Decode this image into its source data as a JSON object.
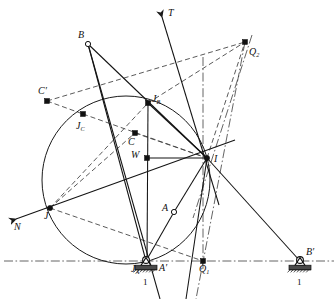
{
  "figure": {
    "type": "geometric-diagram",
    "width": 334,
    "height": 299,
    "stroke_color": "#1a1a1a",
    "accent_color": "#555555",
    "ground_hatch_color": "#3a3a3a"
  },
  "points": [
    {
      "id": "B",
      "label": "B",
      "marker": "open-circle",
      "x": 88,
      "y": 44,
      "lx": 78,
      "ly": 30
    },
    {
      "id": "Q2",
      "label": "Q",
      "sub": "2",
      "marker": "dot",
      "x": 245,
      "y": 42,
      "lx": 249,
      "ly": 47
    },
    {
      "id": "Cp",
      "label": "C",
      "prime": "′",
      "marker": "dot",
      "x": 47,
      "y": 101,
      "lx": 38,
      "ly": 86
    },
    {
      "id": "JB",
      "label": "J",
      "sub": "B",
      "marker": "dot",
      "x": 148,
      "y": 103,
      "lx": 152,
      "ly": 94
    },
    {
      "id": "JC",
      "label": "J",
      "sub": "C",
      "marker": "dot",
      "x": 83,
      "y": 114,
      "lx": 76,
      "ly": 121
    },
    {
      "id": "C",
      "label": "C",
      "marker": "dot",
      "x": 135,
      "y": 133,
      "lx": 128,
      "ly": 137
    },
    {
      "id": "W",
      "label": "W",
      "marker": "dot",
      "x": 147,
      "y": 158,
      "lx": 131,
      "ly": 150
    },
    {
      "id": "I",
      "label": "I",
      "marker": "node",
      "x": 207,
      "y": 158,
      "lx": 214,
      "ly": 154
    },
    {
      "id": "J",
      "label": "J",
      "marker": "node",
      "x": 50,
      "y": 208,
      "lx": 44,
      "ly": 211
    },
    {
      "id": "A",
      "label": "A",
      "marker": "open-circle",
      "x": 174,
      "y": 212,
      "lx": 162,
      "ly": 203
    },
    {
      "id": "JA",
      "label": "J",
      "sub": "A",
      "marker": "pivot",
      "x": 146,
      "y": 261,
      "lx": 131,
      "ly": 264
    },
    {
      "id": "Ap",
      "label": "A",
      "prime": "′",
      "marker": "none",
      "x": 163,
      "y": 261,
      "lx": 159,
      "ly": 263
    },
    {
      "id": "Q1",
      "label": "Q",
      "sub": "1",
      "marker": "dot",
      "x": 203,
      "y": 261,
      "lx": 199,
      "ly": 264
    },
    {
      "id": "Bp",
      "label": "B",
      "prime": "′",
      "marker": "pivot",
      "x": 300,
      "y": 261,
      "lx": 306,
      "ly": 247
    }
  ],
  "axis_labels": [
    {
      "id": "T",
      "label": "T",
      "lx": 168,
      "ly": 8
    },
    {
      "id": "N",
      "label": "N",
      "lx": 14,
      "ly": 222
    }
  ],
  "ground_symbols": [
    {
      "id": "ground-left",
      "label": "1",
      "x": 146,
      "y": 261,
      "lx": 143,
      "ly": 278
    },
    {
      "id": "ground-right",
      "label": "1",
      "x": 300,
      "y": 261,
      "lx": 297,
      "ly": 278
    }
  ],
  "circle": {
    "cx": 126,
    "cy": 180,
    "r": 84,
    "name": "inflection-circle"
  },
  "construction": {
    "solid_lines": [
      {
        "name": "B-to-JA",
        "x1": 88,
        "y1": 44,
        "x2": 146,
        "y2": 261
      },
      {
        "name": "B-to-I",
        "x1": 88,
        "y1": 44,
        "x2": 207,
        "y2": 158
      },
      {
        "name": "B-to-W",
        "x1": 88,
        "y1": 44,
        "x2": 160,
        "y2": 299
      },
      {
        "name": "JA-to-A",
        "x1": 146,
        "y1": 261,
        "x2": 174,
        "y2": 212
      },
      {
        "name": "A-to-I",
        "x1": 174,
        "y1": 212,
        "x2": 207,
        "y2": 158
      },
      {
        "name": "I-to-Bp",
        "x1": 207,
        "y1": 158,
        "x2": 300,
        "y2": 261
      },
      {
        "name": "JB-to-I",
        "x1": 148,
        "y1": 103,
        "x2": 207,
        "y2": 158
      },
      {
        "name": "JB-vert",
        "x1": 148,
        "y1": 103,
        "x2": 147,
        "y2": 261
      },
      {
        "name": "W-to-I",
        "x1": 147,
        "y1": 158,
        "x2": 207,
        "y2": 158
      },
      {
        "name": "N-axis",
        "x1": 16,
        "y1": 219,
        "x2": 235,
        "y2": 140
      },
      {
        "name": "T-axis",
        "x1": 162,
        "y1": 17,
        "x2": 219,
        "y2": 205
      },
      {
        "name": "I-ray-down",
        "x1": 207,
        "y1": 158,
        "x2": 186,
        "y2": 299
      }
    ],
    "dashed_lines": [
      {
        "name": "Cp-to-Q2",
        "x1": 47,
        "y1": 101,
        "x2": 245,
        "y2": 42
      },
      {
        "name": "Cp-to-JC",
        "x1": 47,
        "y1": 101,
        "x2": 83,
        "y2": 114
      },
      {
        "name": "JC-to-I",
        "x1": 83,
        "y1": 114,
        "x2": 207,
        "y2": 158
      },
      {
        "name": "JB-to-Q2",
        "x1": 148,
        "y1": 103,
        "x2": 245,
        "y2": 42
      },
      {
        "name": "J-to-JB",
        "x1": 50,
        "y1": 208,
        "x2": 148,
        "y2": 103
      },
      {
        "name": "J-to-C",
        "x1": 50,
        "y1": 208,
        "x2": 135,
        "y2": 133
      },
      {
        "name": "J-to-Q1",
        "x1": 50,
        "y1": 208,
        "x2": 203,
        "y2": 261
      },
      {
        "name": "C-to-I",
        "x1": 135,
        "y1": 133,
        "x2": 207,
        "y2": 158
      },
      {
        "name": "I-to-Q2",
        "x1": 207,
        "y1": 158,
        "x2": 245,
        "y2": 42
      }
    ],
    "dash_dot_lines": [
      {
        "name": "ground-line",
        "x1": 4,
        "y1": 261,
        "x2": 334,
        "y2": 261
      },
      {
        "name": "Q1-vertical",
        "x1": 203,
        "y1": 57,
        "x2": 203,
        "y2": 272
      },
      {
        "name": "Q2-to-Q1",
        "x1": 245,
        "y1": 42,
        "x2": 196,
        "y2": 299
      },
      {
        "name": "Q2-to-I-ray",
        "x1": 252,
        "y1": 35,
        "x2": 193,
        "y2": 218
      }
    ]
  },
  "legend": {
    "solid": "mechanism links and axes",
    "dashed": "auxiliary construction lines",
    "dash_dot": "frame / centre lines"
  }
}
